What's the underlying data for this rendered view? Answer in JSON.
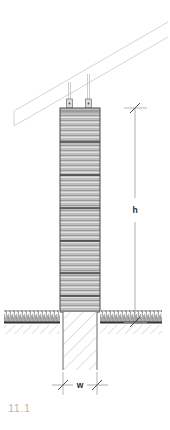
{
  "figure": {
    "label": "11.1",
    "label_color": "#b9b9b9"
  },
  "dimensions": {
    "height_label": "h",
    "width_label": "w",
    "text_color": "#2b2b2b"
  },
  "colors": {
    "outline": "#4a4a4a",
    "rail_line": "#c9c9c9",
    "post_fill": "#c4c4c4",
    "grain_dark": "#8f8f8f",
    "grain_light": "#dcdcdc",
    "segment_line": "#3d3d3d",
    "bracket_fill": "#d6d6d6",
    "bracket_outline": "#6b6b6b",
    "ground_line": "#3a3a3a",
    "grass": "#4d4d4d",
    "soil_hatch": "#9a9a9a",
    "concrete_hatch": "#b5b5b5",
    "concrete_outline": "#5a5a5a",
    "dim_line": "#8a8a8a",
    "dim_tick": "#3a3a3a"
  },
  "parts": {
    "rail": "diagonal-rail",
    "brackets": [
      "bracket-left",
      "bracket-right"
    ],
    "post": "timber-post",
    "footing": "concrete-footing",
    "ground": "ground-line",
    "grass_left": "grass-left",
    "grass_right": "grass-right"
  },
  "geometry": {
    "post_left": 60,
    "post_right": 100,
    "post_top": 108,
    "post_bottom": 312,
    "footing_left": 63,
    "footing_right": 97,
    "footing_bottom": 370,
    "ground_y": 322,
    "segment_lines": [
      142,
      175,
      208,
      241,
      273,
      296
    ],
    "h_dim_x": 135,
    "w_dim_y": 385
  }
}
